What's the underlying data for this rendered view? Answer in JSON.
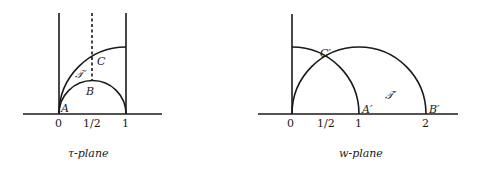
{
  "left_figure": {
    "caption": "τ-plane",
    "tick_labels": [
      "0",
      "1/2",
      "1"
    ],
    "point_labels": {
      "A": "A",
      "B": "B",
      "C": "C"
    },
    "region_label": "𝒯"
  },
  "right_figure": {
    "caption": "w-plane",
    "tick_labels": [
      "0",
      "1/2",
      "1",
      "2"
    ],
    "point_labels": {
      "A": "A′",
      "B": "B′",
      "C": "C′"
    },
    "region_label": "𝒯′"
  }
}
